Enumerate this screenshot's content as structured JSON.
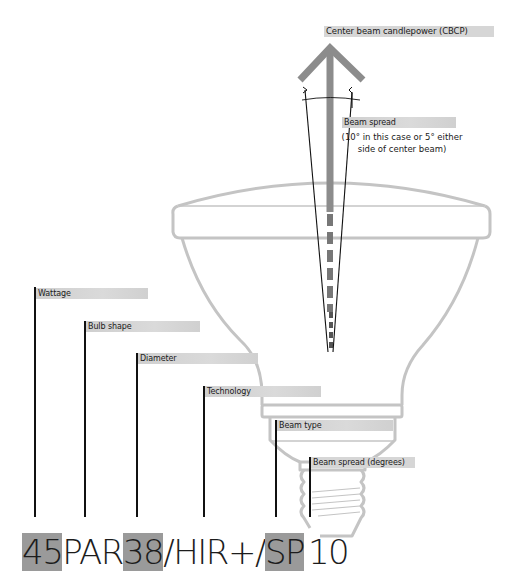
{
  "diagram": {
    "title_label": "Center beam candlepower (CBCP)",
    "beam_spread_label": "Beam spread",
    "beam_spread_note_line1": "(10° in this case or 5° either",
    "beam_spread_note_line2": "side of center beam)",
    "callouts": [
      {
        "id": "wattage",
        "label": "Wattage"
      },
      {
        "id": "bulb-shape",
        "label": "Bulb shape"
      },
      {
        "id": "diameter",
        "label": "Diameter"
      },
      {
        "id": "technology",
        "label": "Technology"
      },
      {
        "id": "beam-type",
        "label": "Beam type"
      },
      {
        "id": "beam-spread-degrees",
        "label": "Beam spread (degrees)"
      }
    ],
    "lamp_code": {
      "segments": [
        {
          "text": "45",
          "highlight": true
        },
        {
          "text": "PAR",
          "highlight": false
        },
        {
          "text": "38",
          "highlight": true
        },
        {
          "text": "/HIR+/",
          "highlight": false
        },
        {
          "text": "SP",
          "highlight": true
        },
        {
          "text": "10",
          "highlight": false
        }
      ]
    },
    "colors": {
      "arrow": "#8c8c8c",
      "bulb_outline": "#c4c4c4",
      "label_bg": "#d6d6d6",
      "code_highlight": "#9a9a9a",
      "lines": "#111111"
    }
  }
}
